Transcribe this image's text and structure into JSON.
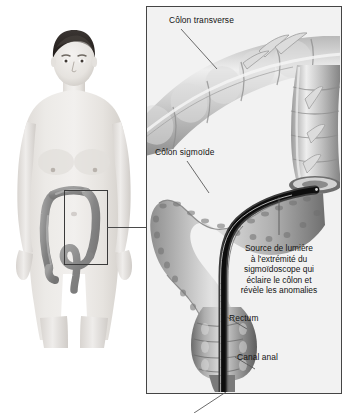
{
  "illustration": {
    "title": "Sigmoidoscopie - anatomie du côlon",
    "language": "fr",
    "style": "grayscale medical illustration",
    "background_color": "#ffffff",
    "panel_background_color": "#f2f2f2",
    "panel_border_color": "#454545",
    "text_color": "#131313",
    "scope_color": "#0d0d0d"
  },
  "body_figure": {
    "name": "male-torso-anterior-view",
    "skin_color": "#e9e6e2",
    "hair_color": "#2e2a28",
    "colon_color": "#8a8a8a",
    "description": "Homme debout, vue antérieure, côlon visible dans l'abdomen"
  },
  "selection_box": {
    "name": "abdomen-zoom-region",
    "border_color": "#3a3a3a"
  },
  "labels": {
    "colon_transverse": "Côlon transverse",
    "colon_sigmoide": "Côlon sigmoïde",
    "rectum": "Rectum",
    "canal_anal": "Canal anal"
  },
  "light_source_note": {
    "lines": [
      "Source de lumière",
      "à l'extrémité du",
      "sigmoïdoscope qui",
      "éclaire le côlon et",
      "révèle les anomalies"
    ]
  }
}
